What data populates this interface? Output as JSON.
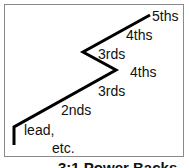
{
  "diagram": {
    "labels": {
      "fifths": "5ths",
      "fourths_top": "4ths",
      "thirds_top": "3rds",
      "fourths_mid": "4ths",
      "thirds_mid": "3rds",
      "seconds": "2nds",
      "lead": "lead,",
      "etc": "etc."
    },
    "caption": "3:1 Power Backs"
  },
  "colors": {
    "line": "#000000",
    "border": "#8a8a8a",
    "text": "#111111"
  }
}
